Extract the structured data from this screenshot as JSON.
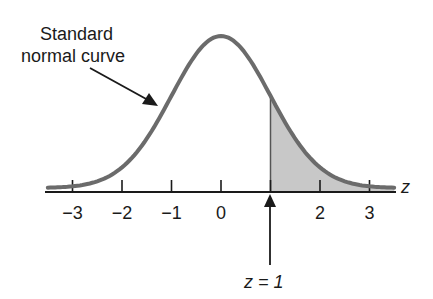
{
  "diagram": {
    "curve_label_line1": "Standard",
    "curve_label_line2": "normal curve",
    "axis_variable": "z",
    "marker_label": "z = 1",
    "ticks": [
      {
        "value": -3,
        "label": "−3"
      },
      {
        "value": -2,
        "label": "−2"
      },
      {
        "value": -1,
        "label": "−1"
      },
      {
        "value": 0,
        "label": "0"
      },
      {
        "value": 1,
        "label": ""
      },
      {
        "value": 2,
        "label": "2"
      },
      {
        "value": 3,
        "label": "3"
      }
    ],
    "shaded_region": {
      "from": 1,
      "to": "infinity"
    },
    "colors": {
      "curve": "#6b6b6b",
      "shade": "#c8c8c8",
      "axis": "#1a1a1a"
    }
  },
  "chart_data": {
    "type": "area",
    "title": "Standard normal curve",
    "xlabel": "z",
    "ylabel": "",
    "xlim": [
      -3.5,
      3.5
    ],
    "x_ticks": [
      -3,
      -2,
      -1,
      0,
      1,
      2,
      3
    ],
    "series": [
      {
        "name": "Standard normal density",
        "function": "exp(-z^2/2)/sqrt(2*pi)"
      }
    ],
    "shaded": {
      "from": 1,
      "to": 3.5
    },
    "annotations": [
      "Standard normal curve",
      "z = 1"
    ]
  }
}
